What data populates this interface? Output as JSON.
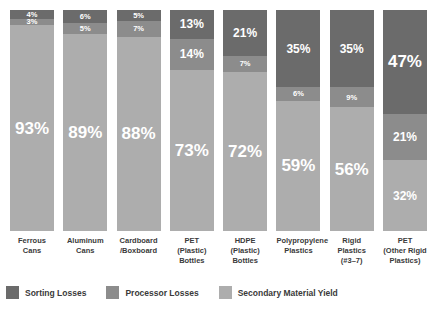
{
  "chart_data": {
    "type": "bar",
    "subtype": "stacked-100-percent",
    "title": "",
    "xlabel": "",
    "ylabel": "",
    "ylim": [
      0,
      100
    ],
    "grid": false,
    "legend_position": "bottom-left",
    "categories": [
      "Ferrous Cans",
      "Aluminum Cans",
      "Cardboard /Boxboard",
      "PET (Plastic) Bottles",
      "HDPE (Plastic) Bottles",
      "Polypropylene Plastics",
      "Rigid Plastics (#3–7)",
      "PET (Other Rigid Plastics)"
    ],
    "series": [
      {
        "name": "Sorting Losses",
        "color": "#6b6b6b",
        "values": [
          4,
          6,
          5,
          13,
          21,
          35,
          35,
          47
        ]
      },
      {
        "name": "Processor Losses",
        "color": "#8c8c8c",
        "values": [
          3,
          5,
          7,
          14,
          7,
          6,
          9,
          21
        ]
      },
      {
        "name": "Secondary Material Yield",
        "color": "#adadad",
        "values": [
          93,
          89,
          88,
          73,
          72,
          59,
          56,
          32
        ]
      }
    ]
  },
  "bars": [
    {
      "category_lines": [
        "Ferrous",
        "Cans"
      ],
      "segments": [
        {
          "series": "Sorting Losses",
          "label": "4%",
          "value": 4,
          "size": "small"
        },
        {
          "series": "Processor Losses",
          "label": "3%",
          "value": 3,
          "size": "small"
        },
        {
          "series": "Secondary Material Yield",
          "label": "93%",
          "value": 93,
          "size": "big"
        }
      ]
    },
    {
      "category_lines": [
        "Aluminum",
        "Cans"
      ],
      "segments": [
        {
          "series": "Sorting Losses",
          "label": "6%",
          "value": 6,
          "size": "small"
        },
        {
          "series": "Processor Losses",
          "label": "5%",
          "value": 5,
          "size": "small"
        },
        {
          "series": "Secondary Material Yield",
          "label": "89%",
          "value": 89,
          "size": "big"
        }
      ]
    },
    {
      "category_lines": [
        "Cardboard",
        "/Boxboard"
      ],
      "segments": [
        {
          "series": "Sorting Losses",
          "label": "5%",
          "value": 5,
          "size": "small"
        },
        {
          "series": "Processor Losses",
          "label": "7%",
          "value": 7,
          "size": "small"
        },
        {
          "series": "Secondary Material Yield",
          "label": "88%",
          "value": 88,
          "size": "big"
        }
      ]
    },
    {
      "category_lines": [
        "PET",
        "(Plastic)",
        "Bottles"
      ],
      "segments": [
        {
          "series": "Sorting Losses",
          "label": "13%",
          "value": 13,
          "size": "mid"
        },
        {
          "series": "Processor Losses",
          "label": "14%",
          "value": 14,
          "size": "mid"
        },
        {
          "series": "Secondary Material Yield",
          "label": "73%",
          "value": 73,
          "size": "big"
        }
      ]
    },
    {
      "category_lines": [
        "HDPE",
        "(Plastic)",
        "Bottles"
      ],
      "segments": [
        {
          "series": "Sorting Losses",
          "label": "21%",
          "value": 21,
          "size": "mid"
        },
        {
          "series": "Processor Losses",
          "label": "7%",
          "value": 7,
          "size": "small"
        },
        {
          "series": "Secondary Material Yield",
          "label": "72%",
          "value": 72,
          "size": "big"
        }
      ]
    },
    {
      "category_lines": [
        "Polypropylene",
        "Plastics"
      ],
      "segments": [
        {
          "series": "Sorting Losses",
          "label": "35%",
          "value": 35,
          "size": "mid"
        },
        {
          "series": "Processor Losses",
          "label": "6%",
          "value": 6,
          "size": "small"
        },
        {
          "series": "Secondary Material Yield",
          "label": "59%",
          "value": 59,
          "size": "big"
        }
      ]
    },
    {
      "category_lines": [
        "Rigid",
        "Plastics",
        "(#3–7)"
      ],
      "segments": [
        {
          "series": "Sorting Losses",
          "label": "35%",
          "value": 35,
          "size": "mid"
        },
        {
          "series": "Processor Losses",
          "label": "9%",
          "value": 9,
          "size": "small"
        },
        {
          "series": "Secondary Material Yield",
          "label": "56%",
          "value": 56,
          "size": "big"
        }
      ]
    },
    {
      "category_lines": [
        "PET",
        "(Other Rigid",
        "Plastics)"
      ],
      "segments": [
        {
          "series": "Sorting Losses",
          "label": "47%",
          "value": 47,
          "size": "big"
        },
        {
          "series": "Processor Losses",
          "label": "21%",
          "value": 21,
          "size": "mid"
        },
        {
          "series": "Secondary Material Yield",
          "label": "32%",
          "value": 32,
          "size": "mid"
        }
      ]
    }
  ],
  "legend": {
    "items": [
      {
        "label": "Sorting Losses",
        "color": "#6b6b6b"
      },
      {
        "label": "Processor Losses",
        "color": "#8c8c8c"
      },
      {
        "label": "Secondary Material Yield",
        "color": "#adadad"
      }
    ]
  },
  "colors": {
    "sorting_losses": "#6b6b6b",
    "processor_losses": "#8c8c8c",
    "secondary_material_yield": "#adadad",
    "background": "#ffffff",
    "text": "#3a3a3a",
    "label_on_bar": "#ffffff"
  }
}
